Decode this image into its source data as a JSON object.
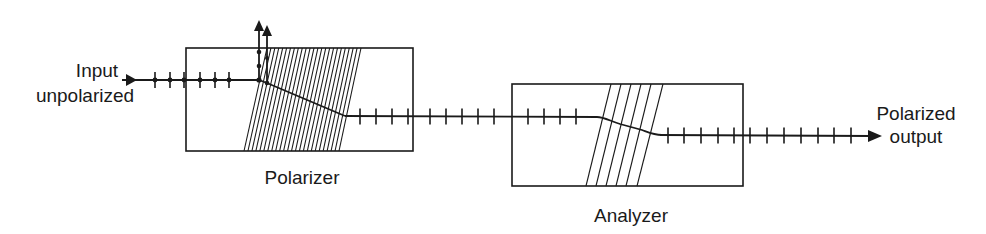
{
  "diagram": {
    "labels": {
      "input_line1": "Input",
      "input_line2": "unpolarized",
      "polarizer": "Polarizer",
      "analyzer": "Analyzer",
      "output_line1": "Polarized",
      "output_line2": "output"
    },
    "components": [
      {
        "name": "polarizer",
        "box": {
          "x": 186,
          "y": 48,
          "w": 227,
          "h": 103
        },
        "hatch": {
          "top_x0": 267,
          "top_x1": 361,
          "bottom_x0": 244,
          "bottom_x1": 339,
          "line_count": 25
        }
      },
      {
        "name": "analyzer",
        "box": {
          "x": 512,
          "y": 84,
          "w": 231,
          "h": 102
        },
        "hatch": {
          "top_x": [
            611,
            621,
            631,
            641,
            651,
            663
          ],
          "bottom_x": [
            586,
            596,
            606,
            616,
            626,
            637
          ]
        }
      }
    ],
    "beams": {
      "input": {
        "y": 80,
        "x_start": 122,
        "x_end": 259,
        "dot_tick_x": [
          155,
          170,
          184,
          200,
          215,
          229
        ]
      },
      "rejected": {
        "x": [
          259,
          267
        ],
        "tip_y": [
          22,
          27
        ],
        "dots_y": [
          52,
          66,
          80
        ]
      },
      "middle": {
        "y": 117,
        "tick_x": [
          360,
          376,
          392,
          408,
          430,
          446,
          462,
          478,
          494,
          528,
          544,
          560,
          576
        ]
      },
      "output": {
        "y": 136,
        "tick_x": [
          668,
          684,
          701,
          718,
          734,
          750,
          767,
          784,
          801,
          818,
          834,
          851
        ],
        "tip_x": 882
      }
    },
    "colors": {
      "ink": "#1a1a1a",
      "background": "#ffffff"
    }
  }
}
